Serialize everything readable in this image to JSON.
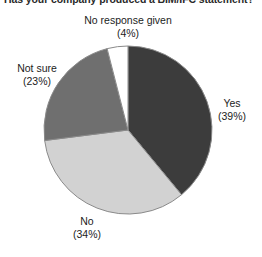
{
  "chart_data": {
    "type": "pie",
    "title": "Has your company produced a BIM/IFC statement?",
    "title_visible_clipped": true,
    "categories": [
      "Yes",
      "No",
      "Not sure",
      "No response given"
    ],
    "values": [
      39,
      34,
      23,
      4
    ],
    "value_unit": "%",
    "labels": [
      {
        "name": "Yes",
        "pct_text": "(39%)",
        "value": 39,
        "color": "#3c3c3c"
      },
      {
        "name": "No",
        "pct_text": "(34%)",
        "value": 34,
        "color": "#d2d2d2"
      },
      {
        "name": "Not sure",
        "pct_text": "(23%)",
        "value": 23,
        "color": "#6f6f6f"
      },
      {
        "name": "No response given",
        "pct_text": "(4%)",
        "value": 4,
        "color": "#ffffff"
      }
    ],
    "colors": [
      "#3c3c3c",
      "#d2d2d2",
      "#6f6f6f",
      "#ffffff"
    ],
    "start_angle_deg": 0,
    "direction": "clockwise",
    "legend": "none",
    "grid": false,
    "xlabel": "",
    "ylabel": ""
  },
  "geometry": {
    "center_x": 128,
    "center_y": 130,
    "radius": 84,
    "outline_color": "#8a8a8a"
  }
}
